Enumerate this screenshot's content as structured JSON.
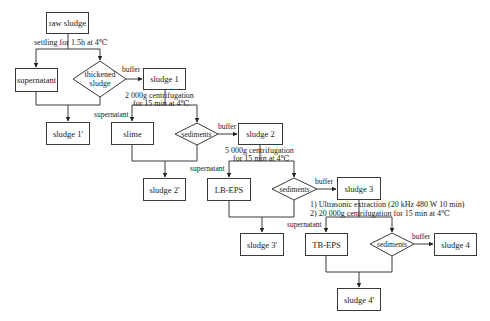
{
  "diagram": {
    "type": "flowchart",
    "title": "",
    "nodes": {
      "raw_sludge": "raw sludge",
      "supernatant_1": "supernatant",
      "thickened_sludge": "thickened sludge",
      "sludge_1": "sludge 1",
      "sludge_1p": "sludge 1'",
      "slime": "slime",
      "sediments_1": "sediments",
      "sludge_2": "sludge 2",
      "sludge_2p": "sludge 2'",
      "lb_eps": "LB-EPS",
      "sediments_2": "sediments",
      "sludge_3": "sludge 3",
      "sludge_3p": "sludge 3'",
      "tb_eps": "TB-EPS",
      "sediments_3": "sediments",
      "sludge_4": "sludge 4",
      "sludge_4p": "sludge 4'"
    },
    "step_notes": {
      "settling": "settling for 1.5h at 4℃",
      "centrifuge_1_line1": "2 000g centrifugation",
      "centrifuge_1_line2": "for 15 min at 4℃",
      "centrifuge_2_line1": "5 000g centrifugation",
      "centrifuge_2_line2": "for 15 min at 4℃",
      "extraction_line1": "1) Ultrasonic extraction (20 kHz 480 W 10 min)",
      "extraction_line2": "2)  20 000g centrifugation for 15 min at 4℃"
    },
    "edge_labels": {
      "buffer_1": "buffer",
      "buffer_2": "buffer",
      "buffer_3": "buffer",
      "buffer_4": "buffer",
      "supernatant_a": "supernatant",
      "supernatant_b": "supernatant",
      "supernatant_c": "supernatant"
    },
    "edges": [
      [
        "raw sludge",
        "supernatant"
      ],
      [
        "raw sludge",
        "thickened sludge"
      ],
      [
        "thickened sludge",
        "sludge 1"
      ],
      [
        "supernatant",
        "sludge 1'"
      ],
      [
        "thickened sludge",
        "sludge 1'"
      ],
      [
        "sludge 1",
        "slime"
      ],
      [
        "sludge 1",
        "sediments"
      ],
      [
        "sediments",
        "sludge 2"
      ],
      [
        "slime",
        "sludge 2'"
      ],
      [
        "sediments",
        "sludge 2'"
      ],
      [
        "sludge 2",
        "LB-EPS"
      ],
      [
        "sludge 2",
        "sediments"
      ],
      [
        "sediments",
        "sludge 3"
      ],
      [
        "LB-EPS",
        "sludge 3'"
      ],
      [
        "sediments",
        "sludge 3'"
      ],
      [
        "sludge 3",
        "TB-EPS"
      ],
      [
        "sludge 3",
        "sediments"
      ],
      [
        "sediments",
        "sludge 4"
      ],
      [
        "TB-EPS",
        "sludge 4'"
      ],
      [
        "sediments",
        "sludge 4'"
      ]
    ]
  },
  "colors": {
    "line": "#3a3a3a",
    "text": "#1a1a1a",
    "background": "#ffffff"
  }
}
